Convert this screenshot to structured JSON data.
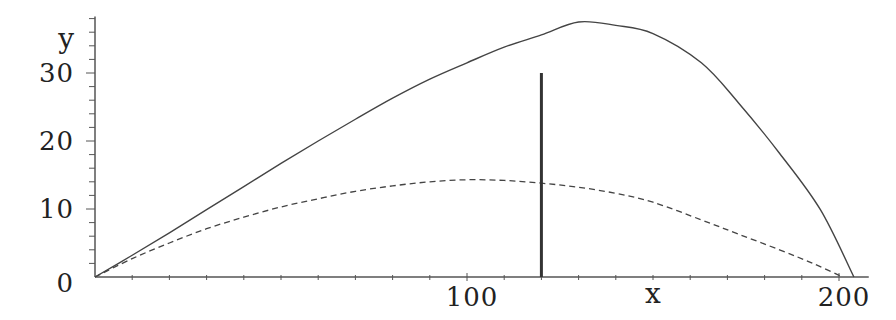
{
  "chart_data": {
    "type": "line",
    "title": "",
    "xlabel": "x",
    "ylabel": "y",
    "xlim": [
      0,
      208
    ],
    "ylim": [
      0,
      38
    ],
    "grid": false,
    "legend": null,
    "x_ticks": [
      100,
      200
    ],
    "y_ticks": [
      0,
      10,
      20,
      30
    ],
    "x_minor_step": 10,
    "y_minor_step": 2,
    "series": [
      {
        "name": "solid curve",
        "style": "solid",
        "x": [
          0,
          10,
          20,
          30,
          40,
          50,
          60,
          70,
          80,
          90,
          100,
          110,
          120,
          130,
          140,
          150,
          163,
          173,
          184,
          195,
          204
        ],
        "y": [
          0,
          3.2,
          6.5,
          9.9,
          13.3,
          16.7,
          20,
          23.2,
          26.3,
          29.1,
          31.5,
          33.8,
          35.6,
          37.5,
          37.0,
          35.8,
          31.5,
          25.6,
          18.2,
          9.9,
          0
        ]
      },
      {
        "name": "dashed curve",
        "style": "dashed",
        "x": [
          0,
          10,
          20,
          30,
          40,
          50,
          60,
          70,
          80,
          90,
          100,
          110,
          120,
          130,
          140,
          150,
          163,
          173,
          184,
          193,
          201
        ],
        "y": [
          0,
          2.7,
          5.0,
          7.1,
          8.8,
          10.3,
          11.5,
          12.6,
          13.4,
          14.0,
          14.3,
          14.2,
          13.8,
          13.2,
          12.3,
          11.0,
          8.4,
          6.3,
          4.0,
          2.0,
          0
        ]
      }
    ],
    "annotations": [
      {
        "type": "vertical-line",
        "x": 120,
        "y_from": 0,
        "y_to": 30
      }
    ]
  },
  "axes": {
    "x_label": "x",
    "y_label": "y",
    "x_tick_labels": [
      "100",
      "200"
    ],
    "y_tick_labels": [
      "0",
      "10",
      "20",
      "30"
    ]
  }
}
